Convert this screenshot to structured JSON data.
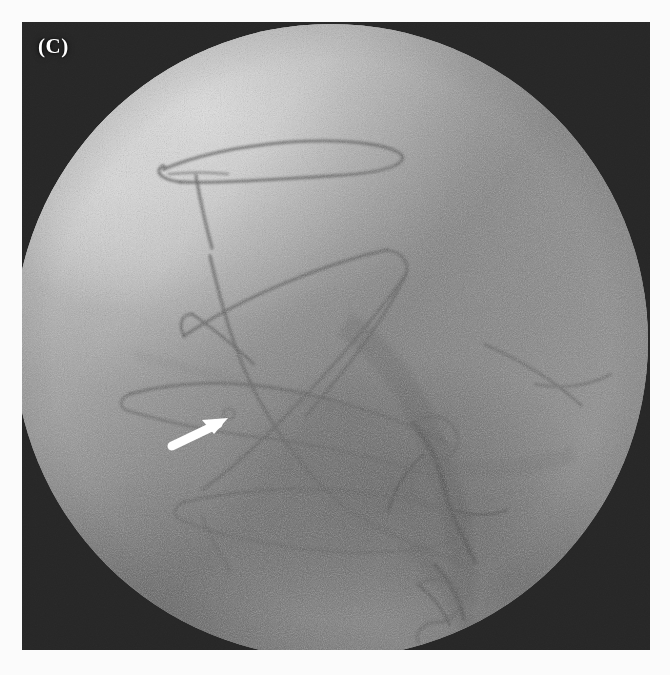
{
  "figure": {
    "panel_label": "(C)",
    "modality": "fluoroscopy"
  },
  "colors": {
    "margin": "#fbfbfb",
    "panel_background": "#262626",
    "field_of_view_midtone": "#9a9a9a",
    "bright_tissue": "#d9d9d9",
    "dark_tissue_band": "#6f6f6f",
    "wire_radiopaque": "#585858",
    "annotation_arrow": "#ffffff",
    "label_text": "#ffffff"
  },
  "panel": {
    "left": 22,
    "top": 22,
    "width": 628,
    "height": 628
  },
  "field_of_view": {
    "shape": "circle",
    "center_x": 309,
    "center_y": 319,
    "radius": 317,
    "cropped_edges": [
      "left",
      "bottom"
    ]
  },
  "annotations": [
    {
      "name": "roi-arrow",
      "type": "arrow",
      "color": "#ffffff",
      "tail_x": 150,
      "tail_y": 422,
      "tip_x": 201,
      "tip_y": 397,
      "description": "white arrow pointing up-right at the device/vessel interface"
    },
    {
      "name": "panel-label",
      "type": "text",
      "text": "(C)",
      "x": 16,
      "y": 12,
      "color": "#ffffff"
    }
  ],
  "radiopaque_structures": [
    {
      "name": "upper-wire-loop",
      "region": "upper-left-quadrant",
      "shape": "elongated-loop-with-hook"
    },
    {
      "name": "mid-wire-triangle",
      "region": "central",
      "shape": "triangular-loop"
    },
    {
      "name": "crossing-wires",
      "region": "central",
      "shape": "x-crossing-strands"
    },
    {
      "name": "lower-wire-loop",
      "region": "lower-left-quadrant",
      "shape": "elongated-loop"
    },
    {
      "name": "distal-coil-mass",
      "region": "lower-right-quadrant",
      "shape": "dense-coil-cluster"
    }
  ]
}
